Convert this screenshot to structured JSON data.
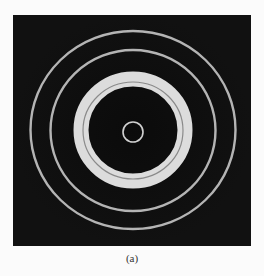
{
  "figure": {
    "caption": "(a)",
    "colors": {
      "background": "#0b0b0b",
      "page": "#fbfbfb",
      "bright_ring": "#dcdcdc",
      "thin_ring": "#b4b4b4",
      "inner_line": "#8a8a8a"
    },
    "center": [
      120,
      115
    ],
    "rings": [
      {
        "name": "central-ring",
        "rx": 10,
        "ry": 10,
        "width": 1.6
      },
      {
        "name": "bright-thick-ring",
        "rx": 52,
        "ry": 51,
        "width": 15
      },
      {
        "name": "second-ring",
        "rx": 82.5,
        "ry": 80.5,
        "width": 2.4
      },
      {
        "name": "outer-ring",
        "rx": 102.5,
        "ry": 99,
        "width": 2.4
      }
    ]
  }
}
